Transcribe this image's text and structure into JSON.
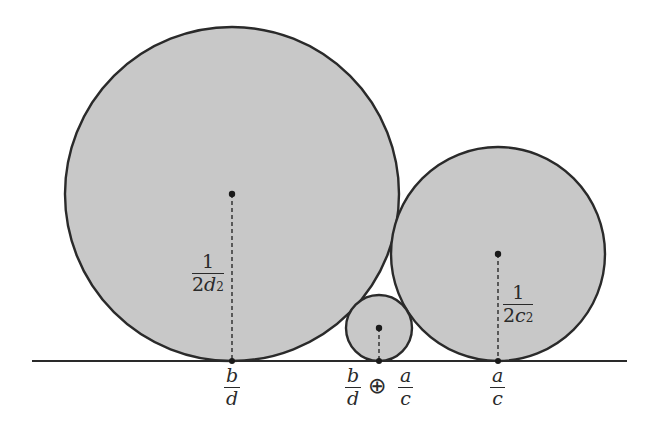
{
  "diagram": {
    "type": "ford-circles-mediant",
    "colors": {
      "circle_fill": "#c8c8c8",
      "stroke": "#2a2a2a",
      "background": "#ffffff"
    },
    "baseline": {
      "x1": 32,
      "x2": 627,
      "y": 361
    },
    "circles": [
      {
        "id": "large",
        "cx": 232,
        "cy": 194,
        "r": 167,
        "radius_label": {
          "numerator": "1",
          "coef": "2",
          "var": "d",
          "exp": "2"
        },
        "base_label": {
          "numerator": "b",
          "denominator": "d"
        }
      },
      {
        "id": "small",
        "cx": 379,
        "cy": 328,
        "r": 33,
        "base_label": {
          "left_num": "b",
          "left_den": "d",
          "operator": "⊕",
          "right_num": "a",
          "right_den": "c"
        }
      },
      {
        "id": "medium",
        "cx": 498,
        "cy": 254,
        "r": 107,
        "radius_label": {
          "numerator": "1",
          "coef": "2",
          "var": "c",
          "exp": "2"
        },
        "base_label": {
          "numerator": "a",
          "denominator": "c"
        }
      }
    ]
  }
}
